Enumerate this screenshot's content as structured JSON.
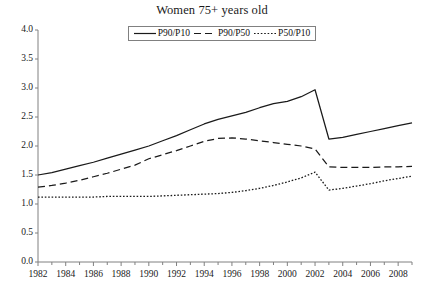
{
  "chart_data": {
    "type": "line",
    "title": "Women 75+ years old",
    "xlabel": "",
    "ylabel": "",
    "xlim": [
      1982,
      2009
    ],
    "ylim": [
      0.0,
      4.0
    ],
    "grid": false,
    "legend_position": "top-center",
    "x": [
      1982,
      1983,
      1984,
      1985,
      1986,
      1987,
      1988,
      1989,
      1990,
      1991,
      1992,
      1993,
      1994,
      1995,
      1996,
      1997,
      1998,
      1999,
      2000,
      2001,
      2002,
      2003,
      2004,
      2005,
      2006,
      2007,
      2008,
      2009
    ],
    "ytick_labels": [
      "0.0",
      "0.5",
      "1.0",
      "1.5",
      "2.0",
      "2.5",
      "3.0",
      "3.5",
      "4.0"
    ],
    "ytick_values": [
      0.0,
      0.5,
      1.0,
      1.5,
      2.0,
      2.5,
      3.0,
      3.5,
      4.0
    ],
    "xtick_labels": [
      "1982",
      "1984",
      "1986",
      "1988",
      "1990",
      "1992",
      "1994",
      "1996",
      "1998",
      "2000",
      "2002",
      "2004",
      "2006",
      "2008"
    ],
    "xtick_values": [
      1982,
      1984,
      1986,
      1988,
      1990,
      1992,
      1994,
      1996,
      1998,
      2000,
      2002,
      2004,
      2006,
      2008
    ],
    "xminor_values": [
      1983,
      1985,
      1987,
      1989,
      1991,
      1993,
      1995,
      1997,
      1999,
      2001,
      2003,
      2005,
      2007,
      2009
    ],
    "series": [
      {
        "name": "P90/P10",
        "style": "solid",
        "color": "#1a1a1a",
        "values": [
          1.5,
          1.54,
          1.6,
          1.66,
          1.72,
          1.79,
          1.86,
          1.93,
          2.0,
          2.09,
          2.18,
          2.28,
          2.38,
          2.46,
          2.52,
          2.58,
          2.66,
          2.73,
          2.77,
          2.85,
          2.97,
          2.12,
          2.15,
          2.2,
          2.25,
          2.3,
          2.35,
          2.4
        ]
      },
      {
        "name": "P90/P50",
        "style": "dashed",
        "color": "#1a1a1a",
        "values": [
          1.29,
          1.32,
          1.36,
          1.41,
          1.47,
          1.53,
          1.6,
          1.67,
          1.78,
          1.85,
          1.92,
          2.0,
          2.08,
          2.13,
          2.14,
          2.12,
          2.09,
          2.06,
          2.03,
          2.0,
          1.95,
          1.64,
          1.63,
          1.63,
          1.63,
          1.64,
          1.64,
          1.65
        ]
      },
      {
        "name": "P50/P10",
        "style": "dotted",
        "color": "#1a1a1a",
        "values": [
          1.12,
          1.12,
          1.12,
          1.12,
          1.12,
          1.13,
          1.13,
          1.13,
          1.13,
          1.14,
          1.15,
          1.16,
          1.17,
          1.18,
          1.2,
          1.23,
          1.27,
          1.32,
          1.38,
          1.45,
          1.55,
          1.24,
          1.27,
          1.31,
          1.35,
          1.4,
          1.44,
          1.48
        ]
      }
    ]
  },
  "legend": {
    "entries": [
      {
        "label": "P90/P10",
        "style": "solid"
      },
      {
        "label": "P90/P50",
        "style": "dashed"
      },
      {
        "label": "P50/P10",
        "style": "dotted"
      }
    ]
  },
  "colors": {
    "background": "#ffffff",
    "axis": "#808080",
    "line": "#1a1a1a",
    "text": "#1a1a1a"
  }
}
